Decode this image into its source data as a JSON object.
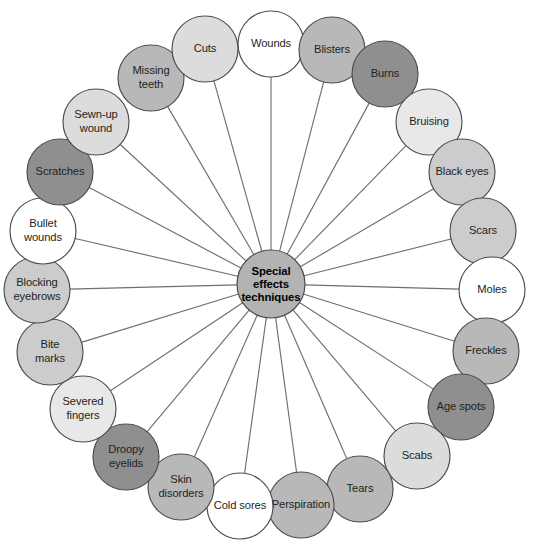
{
  "diagram": {
    "type": "radial-hub-and-spoke",
    "hub": {
      "label_lines": [
        "Special",
        "effects",
        "techniques"
      ],
      "label": "Special effects techniques",
      "fill": "#b3b3b3",
      "stroke": "#4d4d4d",
      "cx": 271,
      "cy": 284,
      "r": 34
    },
    "geometry": {
      "canvas_width": 537,
      "canvas_height": 540,
      "ring_radius": 222,
      "node_radius": 33,
      "line_color": "#6f6f6f"
    },
    "palette": {
      "white": "#ffffff",
      "very_light": "#e8e8e8",
      "light": "#dcdcdc",
      "medium_light": "#cccccc",
      "medium": "#b8b8b8",
      "medium_dark": "#ababab",
      "dark": "#8f8f8f"
    },
    "nodes": [
      {
        "id": "wounds",
        "label": "Wounds",
        "lines": [
          "Wounds"
        ],
        "fill": "#ffffff",
        "angle_deg": -90,
        "cx": 271,
        "cy": 44
      },
      {
        "id": "blisters",
        "label": "Blisters",
        "lines": [
          "Blisters"
        ],
        "fill": "#b8b8b8",
        "angle_deg": -74,
        "cx": 332,
        "cy": 50
      },
      {
        "id": "burns",
        "label": "Burns",
        "lines": [
          "Burns"
        ],
        "fill": "#8f8f8f",
        "angle_deg": -59,
        "cx": 385,
        "cy": 74
      },
      {
        "id": "bruising",
        "label": "Bruising",
        "lines": [
          "Bruising"
        ],
        "fill": "#e8e8e8",
        "angle_deg": -44,
        "cx": 429,
        "cy": 122
      },
      {
        "id": "black-eyes",
        "label": "Black eyes",
        "lines": [
          "Black eyes"
        ],
        "fill": "#cccccc",
        "angle_deg": -30,
        "cx": 462,
        "cy": 172
      },
      {
        "id": "scars",
        "label": "Scars",
        "lines": [
          "Scars"
        ],
        "fill": "#cccccc",
        "angle_deg": -17,
        "cx": 483,
        "cy": 231
      },
      {
        "id": "moles",
        "label": "Moles",
        "lines": [
          "Moles"
        ],
        "fill": "#ffffff",
        "angle_deg": -2,
        "cx": 492,
        "cy": 290
      },
      {
        "id": "freckles",
        "label": "Freckles",
        "lines": [
          "Freckles"
        ],
        "fill": "#b8b8b8",
        "angle_deg": 13,
        "cx": 486,
        "cy": 351
      },
      {
        "id": "age-spots",
        "label": "Age spots",
        "lines": [
          "Age spots"
        ],
        "fill": "#8f8f8f",
        "angle_deg": 28,
        "cx": 461,
        "cy": 407
      },
      {
        "id": "scabs",
        "label": "Scabs",
        "lines": [
          "Scabs"
        ],
        "fill": "#dcdcdc",
        "angle_deg": 43,
        "cx": 417,
        "cy": 456
      },
      {
        "id": "tears",
        "label": "Tears",
        "lines": [
          "Tears"
        ],
        "fill": "#b8b8b8",
        "angle_deg": 58,
        "cx": 360,
        "cy": 489
      },
      {
        "id": "perspiration",
        "label": "Perspiration",
        "lines": [
          "Perspiration"
        ],
        "fill": "#b8b8b8",
        "angle_deg": 73,
        "cx": 301,
        "cy": 505
      },
      {
        "id": "cold-sores",
        "label": "Cold sores",
        "lines": [
          "Cold sores"
        ],
        "fill": "#ffffff",
        "angle_deg": 88,
        "cx": 240,
        "cy": 506
      },
      {
        "id": "skin-disorders",
        "label": "Skin disorders",
        "lines": [
          "Skin",
          "disorders"
        ],
        "fill": "#b8b8b8",
        "angle_deg": 103,
        "cx": 181,
        "cy": 487
      },
      {
        "id": "droopy-eyelids",
        "label": "Droopy eyelids",
        "lines": [
          "Droopy",
          "eyelids"
        ],
        "fill": "#8f8f8f",
        "angle_deg": 118,
        "cx": 126,
        "cy": 457
      },
      {
        "id": "severed-fingers",
        "label": "Severed fingers",
        "lines": [
          "Severed",
          "fingers"
        ],
        "fill": "#e8e8e8",
        "angle_deg": 133,
        "cx": 83,
        "cy": 409
      },
      {
        "id": "bite-marks",
        "label": "Bite marks",
        "lines": [
          "Bite",
          "marks"
        ],
        "fill": "#cccccc",
        "angle_deg": 148,
        "cx": 50,
        "cy": 352
      },
      {
        "id": "blocking-eyebrows",
        "label": "Blocking eyebrows",
        "lines": [
          "Blocking",
          "eyebrows"
        ],
        "fill": "#cccccc",
        "angle_deg": 163,
        "cx": 37,
        "cy": 290
      },
      {
        "id": "bullet-wounds",
        "label": "Bullet wounds",
        "lines": [
          "Bullet",
          "wounds"
        ],
        "fill": "#ffffff",
        "angle_deg": 178,
        "cx": 43,
        "cy": 231
      },
      {
        "id": "scratches",
        "label": "Scratches",
        "lines": [
          "Scratches"
        ],
        "fill": "#8f8f8f",
        "angle_deg": 193,
        "cx": 60,
        "cy": 172
      },
      {
        "id": "sewn-up-wound",
        "label": "Sewn-up wound",
        "lines": [
          "Sewn-up",
          "wound"
        ],
        "fill": "#dcdcdc",
        "angle_deg": 208,
        "cx": 96,
        "cy": 122
      },
      {
        "id": "missing-teeth",
        "label": "Missing teeth",
        "lines": [
          "Missing",
          "teeth"
        ],
        "fill": "#b8b8b8",
        "angle_deg": 223,
        "cx": 151,
        "cy": 78
      },
      {
        "id": "cuts",
        "label": "Cuts",
        "lines": [
          "Cuts"
        ],
        "fill": "#dcdcdc",
        "angle_deg": 238,
        "cx": 205,
        "cy": 49
      }
    ]
  }
}
